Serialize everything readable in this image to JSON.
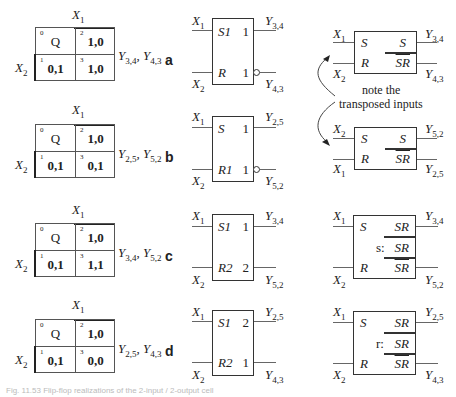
{
  "figure": {
    "caption": "Fig. 11.53 Flip-flop realizations of the 2-input / 2-output cell",
    "rows": [
      {
        "tag": "a",
        "kmap": {
          "x1_label": "X",
          "x1_sub": "1",
          "x2_label": "X",
          "x2_sub": "2",
          "cells": [
            {
              "index": "0",
              "value": "Q"
            },
            {
              "index": "2",
              "value": "1,0"
            },
            {
              "index": "1",
              "value": "0,1"
            },
            {
              "index": "3",
              "value": "1,0"
            }
          ],
          "outputs": {
            "y1": "Y",
            "y1_sub": "3,4",
            "sep": ", ",
            "y2": "Y",
            "y2_sub": "4,3"
          }
        },
        "flipflop": {
          "in_top": {
            "label": "X",
            "sub": "1"
          },
          "in_bot": {
            "label": "X",
            "sub": "2"
          },
          "pin_tl": "S1",
          "pin_tr": "1",
          "pin_bl": "R",
          "pin_br": "1",
          "out_top": {
            "label": "Y",
            "sub": "3,4"
          },
          "out_bot": {
            "label": "Y",
            "sub": "4,3"
          },
          "bubble_bottom": true
        },
        "block": {
          "in_top": {
            "label": "X",
            "sub": "1"
          },
          "in_bot": {
            "label": "X",
            "sub": "2"
          },
          "pin_s": "S",
          "pin_r": "R",
          "out_top_expr": "S",
          "out_bot_expr": "SR",
          "out_top": {
            "label": "Y",
            "sub": "3,4"
          },
          "out_bot": {
            "label": "Y",
            "sub": "4,3"
          }
        }
      },
      {
        "tag": "b",
        "kmap": {
          "x1_label": "X",
          "x1_sub": "1",
          "x2_label": "X",
          "x2_sub": "2",
          "cells": [
            {
              "index": "0",
              "value": "Q"
            },
            {
              "index": "2",
              "value": "1,0"
            },
            {
              "index": "1",
              "value": "0,1"
            },
            {
              "index": "3",
              "value": "0,1"
            }
          ],
          "outputs": {
            "y1": "Y",
            "y1_sub": "2,5",
            "sep": ", ",
            "y2": "Y",
            "y2_sub": "5,2"
          }
        },
        "flipflop": {
          "in_top": {
            "label": "X",
            "sub": "1"
          },
          "in_bot": {
            "label": "X",
            "sub": "2"
          },
          "pin_tl": "S",
          "pin_tr": "1",
          "pin_bl": "R1",
          "pin_br": "1",
          "out_top": {
            "label": "Y",
            "sub": "2,5"
          },
          "out_bot": {
            "label": "Y",
            "sub": "5,2"
          },
          "bubble_bottom": true
        },
        "block": {
          "in_top": {
            "label": "X",
            "sub": "2"
          },
          "in_bot": {
            "label": "X",
            "sub": "1"
          },
          "pin_s": "S",
          "pin_r": "R",
          "out_top_expr": "S",
          "out_bot_expr": "SR",
          "out_top": {
            "label": "Y",
            "sub": "5,2"
          },
          "out_bot": {
            "label": "Y",
            "sub": "2,5"
          }
        }
      },
      {
        "tag": "c",
        "kmap": {
          "x1_label": "X",
          "x1_sub": "1",
          "x2_label": "X",
          "x2_sub": "2",
          "cells": [
            {
              "index": "0",
              "value": "Q"
            },
            {
              "index": "2",
              "value": "1,0"
            },
            {
              "index": "1",
              "value": "0,1"
            },
            {
              "index": "3",
              "value": "1,1"
            }
          ],
          "outputs": {
            "y1": "Y",
            "y1_sub": "3,4",
            "sep": ", ",
            "y2": "Y",
            "y2_sub": "5,2"
          }
        },
        "flipflop": {
          "in_top": {
            "label": "X",
            "sub": "1"
          },
          "in_bot": {
            "label": "X",
            "sub": "2"
          },
          "pin_tl": "S1",
          "pin_tr": "1",
          "pin_bl": "R2",
          "pin_br": "2",
          "out_top": {
            "label": "Y",
            "sub": "3,4"
          },
          "out_bot": {
            "label": "Y",
            "sub": "5,2"
          },
          "bubble_bottom": false
        },
        "block": {
          "in_top": {
            "label": "X",
            "sub": "1"
          },
          "in_bot": {
            "label": "X",
            "sub": "2"
          },
          "pin_s": "S",
          "pin_r": "R",
          "out_top_expr": "SR",
          "mid_prefix": "s:",
          "mid_expr": "SR",
          "out_bot_expr": "SR",
          "out_top": {
            "label": "Y",
            "sub": "3,4"
          },
          "out_bot": {
            "label": "Y",
            "sub": "5,2"
          }
        }
      },
      {
        "tag": "d",
        "kmap": {
          "x1_label": "X",
          "x1_sub": "1",
          "x2_label": "X",
          "x2_sub": "2",
          "cells": [
            {
              "index": "0",
              "value": "Q"
            },
            {
              "index": "2",
              "value": "1,0"
            },
            {
              "index": "1",
              "value": "0,1"
            },
            {
              "index": "3",
              "value": "0,0"
            }
          ],
          "outputs": {
            "y1": "Y",
            "y1_sub": "2,5",
            "sep": ", ",
            "y2": "Y",
            "y2_sub": "4,3"
          }
        },
        "flipflop": {
          "in_top": {
            "label": "X",
            "sub": "1"
          },
          "in_bot": {
            "label": "X",
            "sub": "2"
          },
          "pin_tl": "S1",
          "pin_tr": "2",
          "pin_bl": "R2",
          "pin_br": "1",
          "out_top": {
            "label": "Y",
            "sub": "2,5"
          },
          "out_bot": {
            "label": "Y",
            "sub": "4,3"
          },
          "bubble_bottom": false
        },
        "block": {
          "in_top": {
            "label": "X",
            "sub": "1"
          },
          "in_bot": {
            "label": "X",
            "sub": "2"
          },
          "pin_s": "S",
          "pin_r": "R",
          "out_top_expr": "SR",
          "mid_prefix": "r:",
          "mid_expr": "SR",
          "out_bot_expr": "SR",
          "out_top": {
            "label": "Y",
            "sub": "2,5"
          },
          "out_bot": {
            "label": "Y",
            "sub": "4,3"
          }
        }
      }
    ],
    "note": {
      "line1": "note the",
      "line2": "transposed inputs"
    },
    "icons": {
      "arrow_up": "curved-arrow-up-icon",
      "arrow_down": "curved-arrow-down-icon"
    }
  }
}
